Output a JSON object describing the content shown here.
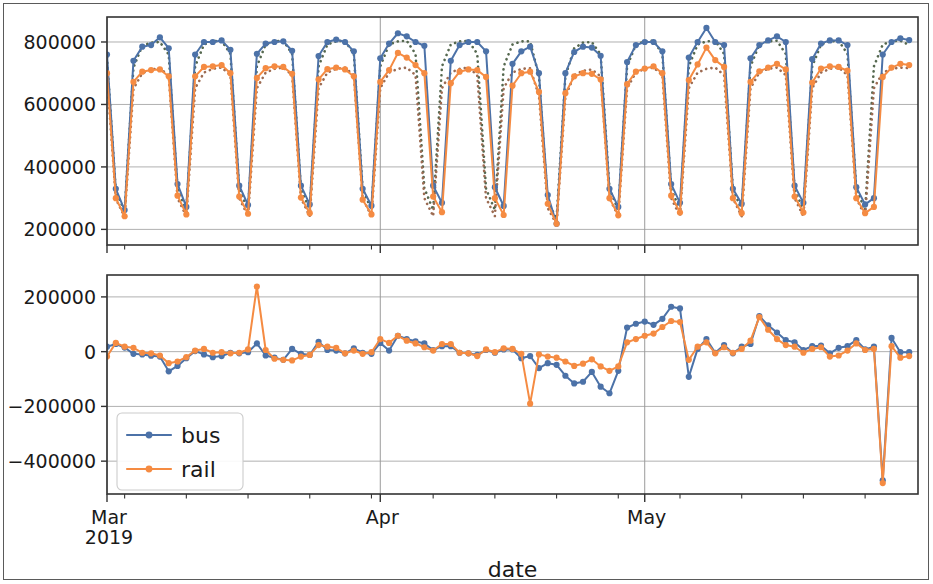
{
  "figure": {
    "width": 933,
    "height": 584,
    "background": "#ffffff",
    "border_color": "#5a5a5a"
  },
  "colors": {
    "bus": "#4c72a8",
    "rail": "#f58b42",
    "bus_predicted": "#55684f",
    "rail_predicted": "#9c6b52",
    "grid": "#b0b0b0",
    "axis": "#333333",
    "text": "#1a1a1a",
    "legend_border": "#cccccc"
  },
  "legend": {
    "position": "lower left",
    "entries": [
      {
        "label": "bus",
        "color": "#4c72a8",
        "marker": "circle",
        "linestyle": "solid"
      },
      {
        "label": "rail",
        "color": "#f58b42",
        "marker": "circle",
        "linestyle": "solid"
      }
    ]
  },
  "chart_data": [
    {
      "id": "ridership-panel",
      "type": "line",
      "title": "",
      "xlabel": "",
      "ylabel": "",
      "ylim": [
        150000,
        880000
      ],
      "yticks": [
        200000,
        400000,
        600000,
        800000
      ],
      "ytick_labels": [
        "200000",
        "400000",
        "600000",
        "800000"
      ],
      "xlim": [
        "2019-03-01",
        "2019-06-01"
      ],
      "xticks_major": [
        "2019-03-01",
        "2019-04-01",
        "2019-05-01"
      ],
      "xtick_major_labels": [
        "Mar",
        "Apr",
        "May"
      ],
      "xtick_major_sublabel": "2019",
      "xticks_minor": [
        "2019-03-03",
        "2019-03-10",
        "2019-03-17",
        "2019-03-24",
        "2019-03-31",
        "2019-04-07",
        "2019-04-14",
        "2019-04-21",
        "2019-04-28",
        "2019-05-05",
        "2019-05-12",
        "2019-05-19",
        "2019-05-26"
      ],
      "grid": true,
      "x": [
        "2019-03-01",
        "2019-03-02",
        "2019-03-03",
        "2019-03-04",
        "2019-03-05",
        "2019-03-06",
        "2019-03-07",
        "2019-03-08",
        "2019-03-09",
        "2019-03-10",
        "2019-03-11",
        "2019-03-12",
        "2019-03-13",
        "2019-03-14",
        "2019-03-15",
        "2019-03-16",
        "2019-03-17",
        "2019-03-18",
        "2019-03-19",
        "2019-03-20",
        "2019-03-21",
        "2019-03-22",
        "2019-03-23",
        "2019-03-24",
        "2019-03-25",
        "2019-03-26",
        "2019-03-27",
        "2019-03-28",
        "2019-03-29",
        "2019-03-30",
        "2019-03-31",
        "2019-04-01",
        "2019-04-02",
        "2019-04-03",
        "2019-04-04",
        "2019-04-05",
        "2019-04-06",
        "2019-04-07",
        "2019-04-08",
        "2019-04-09",
        "2019-04-10",
        "2019-04-11",
        "2019-04-12",
        "2019-04-13",
        "2019-04-14",
        "2019-04-15",
        "2019-04-16",
        "2019-04-17",
        "2019-04-18",
        "2019-04-19",
        "2019-04-20",
        "2019-04-21",
        "2019-04-22",
        "2019-04-23",
        "2019-04-24",
        "2019-04-25",
        "2019-04-26",
        "2019-04-27",
        "2019-04-28",
        "2019-04-29",
        "2019-04-30",
        "2019-05-01",
        "2019-05-02",
        "2019-05-03",
        "2019-05-04",
        "2019-05-05",
        "2019-05-06",
        "2019-05-07",
        "2019-05-08",
        "2019-05-09",
        "2019-05-10",
        "2019-05-11",
        "2019-05-12",
        "2019-05-13",
        "2019-05-14",
        "2019-05-15",
        "2019-05-16",
        "2019-05-17",
        "2019-05-18",
        "2019-05-19",
        "2019-05-20",
        "2019-05-21",
        "2019-05-22",
        "2019-05-23",
        "2019-05-24",
        "2019-05-25",
        "2019-05-26",
        "2019-05-27",
        "2019-05-28",
        "2019-05-29",
        "2019-05-30",
        "2019-05-31"
      ],
      "series": [
        {
          "name": "bus",
          "color": "#4c72a8",
          "linestyle": "solid",
          "marker": "circle",
          "values": [
            760000,
            330000,
            262000,
            740000,
            785000,
            790000,
            815000,
            780000,
            345000,
            272000,
            760000,
            800000,
            800000,
            805000,
            775000,
            340000,
            278000,
            762000,
            795000,
            800000,
            802000,
            772000,
            340000,
            280000,
            755000,
            800000,
            808000,
            800000,
            770000,
            330000,
            276000,
            748000,
            795000,
            828000,
            818000,
            800000,
            788000,
            340000,
            285000,
            740000,
            790000,
            800000,
            800000,
            770000,
            335000,
            275000,
            730000,
            770000,
            785000,
            700000,
            310000,
            218000,
            700000,
            768000,
            785000,
            782000,
            756000,
            330000,
            272000,
            736000,
            790000,
            800000,
            800000,
            770000,
            345000,
            285000,
            750000,
            800000,
            845000,
            800000,
            790000,
            330000,
            282000,
            748000,
            790000,
            805000,
            818000,
            800000,
            340000,
            285000,
            745000,
            795000,
            805000,
            805000,
            790000,
            335000,
            280000,
            300000,
            760000,
            800000,
            812000,
            806000,
            790000
          ]
        },
        {
          "name": "rail",
          "color": "#f58b42",
          "linestyle": "solid",
          "marker": "circle",
          "values": [
            700000,
            300000,
            242000,
            672000,
            705000,
            710000,
            712000,
            690000,
            308000,
            248000,
            690000,
            720000,
            722000,
            726000,
            700000,
            305000,
            250000,
            685000,
            716000,
            722000,
            720000,
            698000,
            302000,
            252000,
            680000,
            713000,
            718000,
            712000,
            690000,
            295000,
            248000,
            672000,
            710000,
            765000,
            750000,
            726000,
            700000,
            305000,
            255000,
            668000,
            705000,
            712000,
            710000,
            688000,
            300000,
            246000,
            660000,
            700000,
            705000,
            640000,
            282000,
            218000,
            636000,
            690000,
            700000,
            698000,
            680000,
            300000,
            245000,
            665000,
            705000,
            715000,
            722000,
            700000,
            308000,
            254000,
            678000,
            728000,
            782000,
            742000,
            720000,
            300000,
            252000,
            672000,
            706000,
            718000,
            730000,
            712000,
            305000,
            254000,
            670000,
            715000,
            722000,
            720000,
            708000,
            300000,
            252000,
            272000,
            688000,
            718000,
            730000,
            726000,
            716000
          ]
        },
        {
          "name": "bus predicted",
          "color": "#55684f",
          "linestyle": "dotted",
          "marker": "none",
          "values": [
            750000,
            322000,
            258000,
            718000,
            788000,
            798000,
            800000,
            760000,
            330000,
            262000,
            722000,
            792000,
            802000,
            804000,
            762000,
            330000,
            262000,
            722000,
            792000,
            802000,
            804000,
            762000,
            330000,
            262000,
            722000,
            792000,
            802000,
            804000,
            762000,
            330000,
            262000,
            722000,
            792000,
            802000,
            804000,
            762000,
            332000,
            262000,
            722000,
            792000,
            802000,
            804000,
            762000,
            330000,
            262000,
            722000,
            792000,
            802000,
            802000,
            690000,
            290000,
            234000,
            690000,
            780000,
            798000,
            800000,
            760000,
            330000,
            262000,
            722000,
            792000,
            802000,
            804000,
            762000,
            330000,
            262000,
            722000,
            792000,
            802000,
            804000,
            762000,
            330000,
            262000,
            722000,
            792000,
            802000,
            804000,
            762000,
            330000,
            262000,
            722000,
            792000,
            802000,
            804000,
            762000,
            330000,
            262000,
            722000,
            792000,
            802000,
            804000,
            790000,
            770000
          ]
        },
        {
          "name": "rail predicted",
          "color": "#9c6b52",
          "linestyle": "dotted",
          "marker": "none",
          "values": [
            690000,
            298000,
            240000,
            650000,
            700000,
            712000,
            716000,
            692000,
            300000,
            242000,
            652000,
            702000,
            714000,
            718000,
            694000,
            300000,
            242000,
            652000,
            702000,
            714000,
            718000,
            694000,
            300000,
            242000,
            652000,
            702000,
            714000,
            718000,
            694000,
            300000,
            242000,
            652000,
            702000,
            714000,
            718000,
            694000,
            300000,
            242000,
            652000,
            702000,
            714000,
            718000,
            694000,
            300000,
            242000,
            652000,
            702000,
            714000,
            716000,
            628000,
            268000,
            216000,
            624000,
            694000,
            708000,
            712000,
            690000,
            300000,
            242000,
            652000,
            702000,
            714000,
            718000,
            694000,
            300000,
            242000,
            652000,
            702000,
            714000,
            718000,
            694000,
            300000,
            242000,
            652000,
            702000,
            714000,
            718000,
            694000,
            300000,
            242000,
            652000,
            702000,
            714000,
            718000,
            694000,
            300000,
            242000,
            652000,
            702000,
            714000,
            718000,
            716000,
            700000
          ]
        }
      ]
    },
    {
      "id": "residual-panel",
      "type": "line",
      "title": "",
      "xlabel": "date",
      "ylabel": "",
      "ylim": [
        -520000,
        280000
      ],
      "yticks": [
        200000,
        0,
        -200000,
        -400000
      ],
      "ytick_labels": [
        "200000",
        "0",
        "−200000",
        "−400000"
      ],
      "xlim": [
        "2019-03-01",
        "2019-06-01"
      ],
      "xticks_major": [
        "2019-03-01",
        "2019-04-01",
        "2019-05-01"
      ],
      "xtick_major_labels": [
        "Mar",
        "Apr",
        "May"
      ],
      "xtick_major_sublabel": "2019",
      "xticks_minor": [
        "2019-03-03",
        "2019-03-10",
        "2019-03-17",
        "2019-03-24",
        "2019-03-31",
        "2019-04-07",
        "2019-04-14",
        "2019-04-21",
        "2019-04-28",
        "2019-05-05",
        "2019-05-12",
        "2019-05-19",
        "2019-05-26"
      ],
      "grid": true,
      "x": [
        "2019-03-01",
        "2019-03-02",
        "2019-03-03",
        "2019-03-04",
        "2019-03-05",
        "2019-03-06",
        "2019-03-07",
        "2019-03-08",
        "2019-03-09",
        "2019-03-10",
        "2019-03-11",
        "2019-03-12",
        "2019-03-13",
        "2019-03-14",
        "2019-03-15",
        "2019-03-16",
        "2019-03-17",
        "2019-03-18",
        "2019-03-19",
        "2019-03-20",
        "2019-03-21",
        "2019-03-22",
        "2019-03-23",
        "2019-03-24",
        "2019-03-25",
        "2019-03-26",
        "2019-03-27",
        "2019-03-28",
        "2019-03-29",
        "2019-03-30",
        "2019-03-31",
        "2019-04-01",
        "2019-04-02",
        "2019-04-03",
        "2019-04-04",
        "2019-04-05",
        "2019-04-06",
        "2019-04-07",
        "2019-04-08",
        "2019-04-09",
        "2019-04-10",
        "2019-04-11",
        "2019-04-12",
        "2019-04-13",
        "2019-04-14",
        "2019-04-15",
        "2019-04-16",
        "2019-04-17",
        "2019-04-18",
        "2019-04-19",
        "2019-04-20",
        "2019-04-21",
        "2019-04-22",
        "2019-04-23",
        "2019-04-24",
        "2019-04-25",
        "2019-04-26",
        "2019-04-27",
        "2019-04-28",
        "2019-04-29",
        "2019-04-30",
        "2019-05-01",
        "2019-05-02",
        "2019-05-03",
        "2019-05-04",
        "2019-05-05",
        "2019-05-06",
        "2019-05-07",
        "2019-05-08",
        "2019-05-09",
        "2019-05-10",
        "2019-05-11",
        "2019-05-12",
        "2019-05-13",
        "2019-05-14",
        "2019-05-15",
        "2019-05-16",
        "2019-05-17",
        "2019-05-18",
        "2019-05-19",
        "2019-05-20",
        "2019-05-21",
        "2019-05-22",
        "2019-05-23",
        "2019-05-24",
        "2019-05-25",
        "2019-05-26",
        "2019-05-27",
        "2019-05-28",
        "2019-05-29",
        "2019-05-30",
        "2019-05-31"
      ],
      "series": [
        {
          "name": "bus",
          "color": "#4c72a8",
          "linestyle": "solid",
          "marker": "circle",
          "values": [
            18000,
            28000,
            15000,
            -8000,
            -10000,
            -15000,
            -18000,
            -72000,
            -52000,
            -24000,
            2000,
            -10000,
            -20000,
            -16000,
            -4000,
            -6000,
            -2000,
            30000,
            -14000,
            -22000,
            -30000,
            10000,
            -8000,
            -12000,
            36000,
            6000,
            4000,
            -6000,
            12000,
            -4000,
            -8000,
            32000,
            4000,
            58000,
            46000,
            38000,
            30000,
            6000,
            20000,
            20000,
            -4000,
            -6000,
            -12000,
            6000,
            -4000,
            8000,
            8000,
            -24000,
            -16000,
            -60000,
            -42000,
            -48000,
            -88000,
            -116000,
            -110000,
            -74000,
            -128000,
            -152000,
            -70000,
            88000,
            102000,
            110000,
            98000,
            120000,
            164000,
            158000,
            -92000,
            10000,
            46000,
            -4000,
            24000,
            -6000,
            18000,
            28000,
            130000,
            96000,
            70000,
            42000,
            34000,
            6000,
            20000,
            22000,
            -6000,
            14000,
            20000,
            42000,
            8000,
            18000,
            -470000,
            50000,
            -2000,
            -2000,
            20000,
            80000
          ]
        },
        {
          "name": "rail",
          "color": "#f58b42",
          "linestyle": "solid",
          "marker": "circle",
          "values": [
            -18000,
            32000,
            18000,
            14000,
            -4000,
            -6000,
            -14000,
            -42000,
            -36000,
            -20000,
            4000,
            10000,
            -4000,
            -2000,
            -6000,
            -4000,
            8000,
            238000,
            6000,
            -26000,
            -30000,
            -32000,
            -18000,
            -12000,
            24000,
            18000,
            14000,
            -6000,
            4000,
            -8000,
            -2000,
            46000,
            32000,
            58000,
            40000,
            30000,
            16000,
            4000,
            28000,
            28000,
            -4000,
            -6000,
            -16000,
            8000,
            -2000,
            12000,
            10000,
            -8000,
            -190000,
            -10000,
            -18000,
            -22000,
            -36000,
            -52000,
            -44000,
            -28000,
            -54000,
            -70000,
            -54000,
            34000,
            46000,
            58000,
            66000,
            90000,
            112000,
            108000,
            -30000,
            18000,
            34000,
            -6000,
            16000,
            -4000,
            10000,
            40000,
            126000,
            80000,
            46000,
            24000,
            18000,
            -4000,
            10000,
            16000,
            -18000,
            -14000,
            4000,
            30000,
            6000,
            10000,
            -480000,
            20000,
            -22000,
            -16000,
            -2000,
            78000
          ]
        }
      ]
    }
  ]
}
